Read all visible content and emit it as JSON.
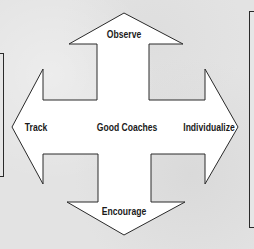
{
  "diagram": {
    "center_label": "Good Coaches",
    "arrows": {
      "up": {
        "label": "Observe"
      },
      "left": {
        "label": "Track"
      },
      "right": {
        "label": "Individualize"
      },
      "down": {
        "label": "Encourage"
      }
    },
    "colors": {
      "background": "#e3e3e3",
      "arrow_fill": "#ffffff",
      "stroke": "#2a2a2a",
      "text": "#1a1a1a"
    }
  }
}
